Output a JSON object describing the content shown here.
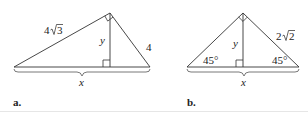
{
  "figures": [
    {
      "part_label": "a.",
      "hypotenuse_label": "x",
      "altitude_label": "y",
      "left_leg_label": "4√3",
      "left_leg_coef": "4",
      "left_leg_radicand": "3",
      "right_leg_label": "4",
      "right_angle_marks": [
        "apex",
        "altitude-foot"
      ]
    },
    {
      "part_label": "b.",
      "hypotenuse_label": "x",
      "altitude_label": "y",
      "right_leg_label": "2√2",
      "right_leg_coef": "2",
      "right_leg_radicand": "2",
      "left_angle_label": "45°",
      "right_angle_label": "45°",
      "right_angle_marks": [
        "apex",
        "altitude-foot"
      ]
    }
  ]
}
